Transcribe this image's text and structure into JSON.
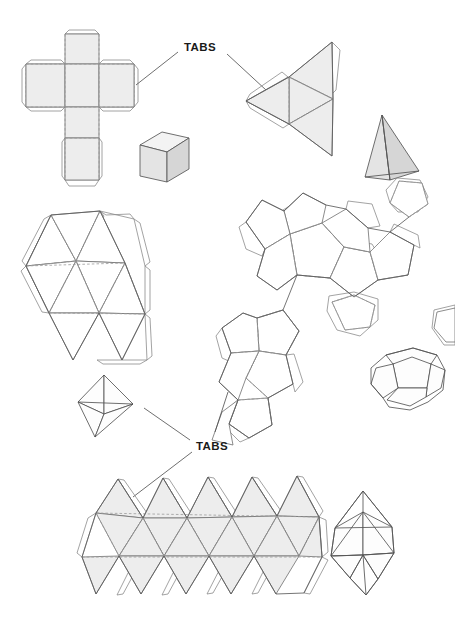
{
  "figure": {
    "background_color": "#ffffff",
    "width": 455,
    "height": 638
  },
  "labels": {
    "tabs_upper": "TABS",
    "tabs_lower": "TABS"
  },
  "colors": {
    "net_fill": "#ededed",
    "net_fill_plain": "#ffffff",
    "cut_stroke": "#5c5c5c",
    "fold_stroke": "#9a9a9a",
    "tab_stroke": "#8c8c8c",
    "solid_light": "#f3f3f3",
    "solid_mid": "#e4e4e4",
    "solid_dark": "#d6d6d6",
    "label_text": "#1a1a1a",
    "leader_line": "#4a4a4a"
  },
  "groups": [
    {
      "id": "cube",
      "net_name": "cube-net",
      "solid_name": "cube-solid",
      "faces": 6,
      "face_shape": "square",
      "net_layout": "latin-cross"
    },
    {
      "id": "tetrahedron",
      "net_name": "tetrahedron-net",
      "solid_name": "tetrahedron-solid",
      "faces": 4,
      "face_shape": "triangle",
      "net_layout": "large-triangle-subdivided"
    },
    {
      "id": "octahedron",
      "net_name": "octahedron-net",
      "solid_name": "octahedron-solid",
      "faces": 8,
      "face_shape": "triangle",
      "net_layout": "triangle-strip"
    },
    {
      "id": "dodecahedron",
      "net_name": "dodecahedron-net",
      "solid_name": "dodecahedron-solid",
      "faces": 12,
      "face_shape": "pentagon",
      "net_layout": "two-pentagon-rosettes"
    },
    {
      "id": "icosahedron",
      "net_name": "icosahedron-net",
      "solid_name": "icosahedron-solid",
      "faces": 20,
      "face_shape": "triangle",
      "net_layout": "triangle-strip-five-wide"
    }
  ]
}
